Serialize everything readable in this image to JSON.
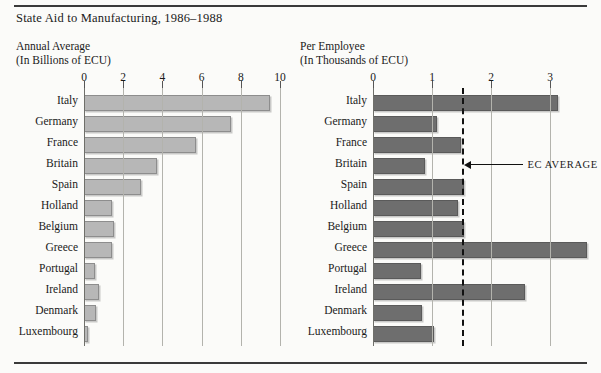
{
  "title": "State Aid to Manufacturing, 1986–1988",
  "colors": {
    "pale_bar": "#b7b7b7",
    "dark_bar": "#6e6e6e",
    "grid": "#b3b3ad",
    "rule": "#3a3a3a",
    "ec_line": "#111111"
  },
  "chart_data": [
    {
      "type": "bar",
      "orientation": "horizontal",
      "title": "Annual Average",
      "subtitle": "(In Billions of ECU)",
      "xlabel": "",
      "ylabel": "",
      "xlim": [
        0,
        10
      ],
      "xticks": [
        0,
        2,
        4,
        6,
        8,
        10
      ],
      "xticklabels": [
        "0",
        "2",
        "4",
        "6",
        "8",
        "10"
      ],
      "grid": true,
      "legend": "none",
      "categories": [
        "Italy",
        "Germany",
        "France",
        "Britain",
        "Spain",
        "Holland",
        "Belgium",
        "Greece",
        "Portugal",
        "Ireland",
        "Denmark",
        "Luxembourg"
      ],
      "values": [
        9.4,
        7.4,
        5.6,
        3.6,
        2.8,
        1.35,
        1.45,
        1.35,
        0.45,
        0.65,
        0.5,
        0.1
      ]
    },
    {
      "type": "bar",
      "orientation": "horizontal",
      "title": "Per Employee",
      "subtitle": "(In Thousands of ECU)",
      "xlabel": "",
      "ylabel": "",
      "xlim": [
        0,
        3.75
      ],
      "xticks": [
        0,
        1,
        2,
        3
      ],
      "xticklabels": [
        "0",
        "1",
        "2",
        "3"
      ],
      "grid": true,
      "legend": "none",
      "categories": [
        "Italy",
        "Germany",
        "France",
        "Britain",
        "Spain",
        "Holland",
        "Belgium",
        "Greece",
        "Portugal",
        "Ireland",
        "Denmark",
        "Luxembourg"
      ],
      "values": [
        3.1,
        1.05,
        1.45,
        0.85,
        1.5,
        1.4,
        1.5,
        3.6,
        0.78,
        2.55,
        0.8,
        1.0
      ],
      "annotations": [
        {
          "label": "EC AVERAGE",
          "type": "vline",
          "value": 1.5,
          "style": "dashed"
        }
      ]
    }
  ]
}
